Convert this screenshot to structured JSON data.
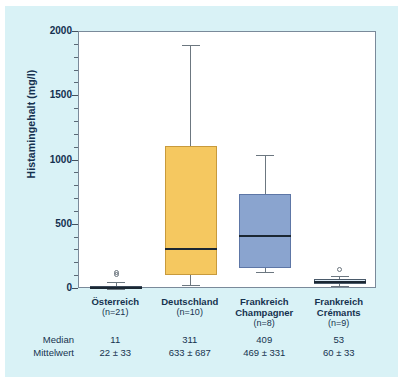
{
  "figure": {
    "background_color": "#d9f2f6",
    "panel_color": "#ffffff",
    "text_color": "#16324f"
  },
  "chart_data": {
    "type": "box",
    "title": "",
    "xlabel": "",
    "ylabel": "Histamingehalt (mg/l)",
    "ylim": [
      0,
      2000
    ],
    "ytick_values": [
      0,
      500,
      1000,
      1500,
      2000
    ],
    "ytick_labels": [
      "0",
      "500",
      "1000",
      "1500",
      "2000"
    ],
    "yminor_step": 100,
    "grid": false,
    "legend": null,
    "categories": [
      "Österreich",
      "Deutschland",
      "Frankreich Champagner",
      "Frankreich Crémants"
    ],
    "boxes": [
      {
        "name": "Österreich",
        "n": 21,
        "whisker_low": 0,
        "q1": 5,
        "median": 11,
        "q3": 25,
        "whisker_high": 55,
        "outliers": [
          110,
          132
        ],
        "fill_color": "#8aa4cf",
        "edge_color": "#3c4a5a"
      },
      {
        "name": "Deutschland",
        "n": 10,
        "whisker_low": 30,
        "q1": 110,
        "median": 310,
        "q3": 1110,
        "whisker_high": 1900,
        "outliers": [],
        "fill_color": "#f5c860",
        "edge_color": "#c89a3c"
      },
      {
        "name": "Frankreich Champagner",
        "n": 8,
        "whisker_low": 130,
        "q1": 165,
        "median": 410,
        "q3": 740,
        "whisker_high": 1040,
        "outliers": [],
        "fill_color": "#8aa4cf",
        "edge_color": "#5d76a6"
      },
      {
        "name": "Frankreich Crémants",
        "n": 9,
        "whisker_low": 25,
        "q1": 40,
        "median": 53,
        "q3": 75,
        "whisker_high": 105,
        "outliers": [
          148
        ],
        "fill_color": "#dceaf5",
        "edge_color": "#4a5a6a"
      }
    ]
  },
  "columns": [
    {
      "name_line1": "Österreich",
      "name_line2": "",
      "n_label": "(n=21)",
      "median": "11",
      "mittelwert": "22 ± 33"
    },
    {
      "name_line1": "Deutschland",
      "name_line2": "",
      "n_label": "(n=10)",
      "median": "311",
      "mittelwert": "633 ± 687"
    },
    {
      "name_line1": "Frankreich",
      "name_line2": "Champagner",
      "n_label": "(n=8)",
      "median": "409",
      "mittelwert": "469 ± 331"
    },
    {
      "name_line1": "Frankreich",
      "name_line2": "Crémants",
      "n_label": "(n=9)",
      "median": "53",
      "mittelwert": "60 ± 33"
    }
  ],
  "row_labels": {
    "median": "Median",
    "mittelwert": "Mittelwert"
  }
}
